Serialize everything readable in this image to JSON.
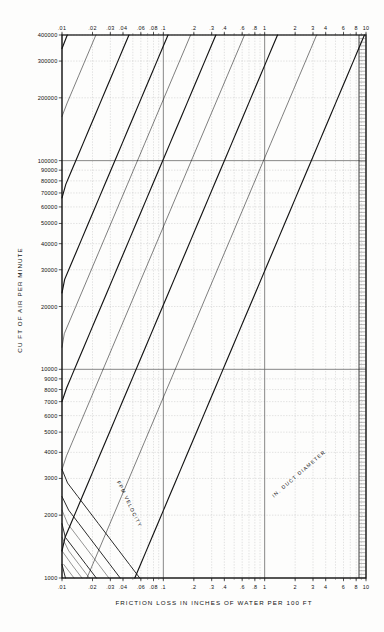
{
  "chart_data": {
    "type": "line",
    "xlabel": "FRICTION LOSS IN INCHES OF WATER PER 100 FT",
    "ylabel": "CU FT OF AIR PER MINUTE",
    "xscale": "log",
    "yscale": "log",
    "xlim": [
      0.01,
      10
    ],
    "ylim": [
      1000,
      400000
    ],
    "grid": true,
    "legend": null,
    "x_tick_labels_top": [
      ".01",
      ".02",
      ".03",
      ".04",
      ".06",
      ".08",
      ".1",
      ".2",
      ".3",
      ".4",
      ".6",
      ".8",
      "1",
      "2",
      "3",
      "4",
      "6",
      "8",
      "10"
    ],
    "x_tick_values_top": [
      0.01,
      0.02,
      0.03,
      0.04,
      0.06,
      0.08,
      0.1,
      0.2,
      0.3,
      0.4,
      0.6,
      0.8,
      1,
      2,
      3,
      4,
      6,
      8,
      10
    ],
    "x_tick_labels_bottom": [
      ".01",
      ".02",
      ".03",
      ".04",
      ".06",
      ".08",
      ".1",
      ".2",
      ".3",
      ".4",
      ".6",
      ".8",
      "1",
      "2",
      "3",
      "4",
      "6",
      "8",
      "10"
    ],
    "x_tick_values_bottom": [
      0.01,
      0.02,
      0.03,
      0.04,
      0.06,
      0.08,
      0.1,
      0.2,
      0.3,
      0.4,
      0.6,
      0.8,
      1,
      2,
      3,
      4,
      6,
      8,
      10
    ],
    "y_tick_labels": [
      "400000",
      "300000",
      "200000",
      "100000",
      "90000",
      "80000",
      "70000",
      "60000",
      "50000",
      "40000",
      "30000",
      "20000",
      "10000",
      "9000",
      "8000",
      "7000",
      "6000",
      "5000",
      "4000",
      "3000",
      "2000",
      "1000"
    ],
    "y_tick_values": [
      400000,
      300000,
      200000,
      100000,
      90000,
      80000,
      70000,
      60000,
      50000,
      40000,
      30000,
      20000,
      10000,
      9000,
      8000,
      7000,
      6000,
      5000,
      4000,
      3000,
      2000,
      1000
    ],
    "families": [
      {
        "name": "ROUND DUCT DIAMETER",
        "unit": "IN.",
        "annotation": "IN. DUCT DIAMETER",
        "orientation": "up-right",
        "values": [
          4,
          5,
          6,
          7,
          8,
          9,
          10,
          12,
          14,
          16,
          18,
          20,
          22,
          24,
          26,
          28,
          30,
          32,
          34,
          36,
          38,
          40,
          45,
          50,
          55,
          60,
          70,
          80,
          90,
          100
        ]
      },
      {
        "name": "FPM VELOCITY",
        "unit": "FPM",
        "annotation": "FPM VELOCITY",
        "orientation": "down-right",
        "values": [
          400,
          600,
          800,
          1000,
          1200,
          1400,
          1600,
          1800,
          2000,
          2200,
          2400,
          2600,
          2800,
          3000,
          3200,
          3400,
          3600,
          3800,
          4000,
          4500,
          5000,
          5500,
          6000,
          6500,
          7000,
          7500,
          8000,
          9000,
          10000,
          12000
        ]
      }
    ],
    "velocity_labels_top": [
      "1600",
      "1800",
      "2000",
      "2200",
      "2400",
      "2600",
      "2800",
      "3000",
      "3200",
      "3400",
      "3600",
      "3800",
      "4000",
      "4500",
      "5000",
      "5500",
      "6000",
      "6500",
      "7000",
      "7500",
      "8000",
      "9000",
      "10000",
      "12000"
    ],
    "velocity_labels_bottom": [
      "400",
      "600",
      "800",
      "1000",
      "1200",
      "1400",
      "1600",
      "1800",
      "2000",
      "2200",
      "2400",
      "2600",
      "2800",
      "3000",
      "3200",
      "3400",
      "4000",
      "4500",
      "5000"
    ],
    "diameter_labels_left": [
      "100",
      "90",
      "80",
      "70",
      "60",
      "55",
      "50",
      "45",
      "40",
      "38",
      "36",
      "34",
      "32",
      "30",
      "28",
      "26",
      "24",
      "23"
    ],
    "diameter_labels_right": [
      "50",
      "45",
      "40",
      "38",
      "36",
      "34",
      "32",
      "30",
      "28",
      "26",
      "24",
      "22",
      "20",
      "18",
      "16",
      "14",
      "12",
      "10",
      "9",
      "8",
      "7",
      "6",
      "5",
      "4"
    ],
    "colors": {
      "background": "#fdfdfc",
      "grid_minor": "#b9b9b9",
      "grid_major": "#6a6a6a",
      "diameter_line": "#141414",
      "velocity_line": "#2a2a2a",
      "text": "#111111"
    }
  }
}
